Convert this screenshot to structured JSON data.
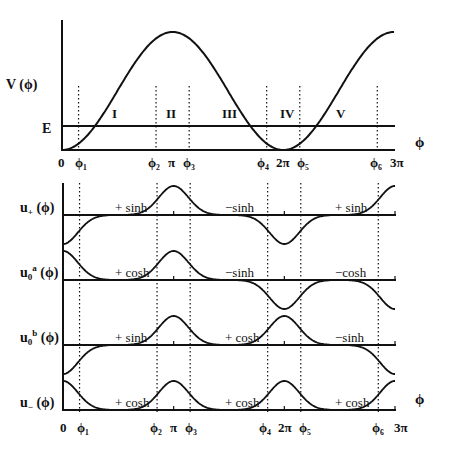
{
  "figure": {
    "top_panel": {
      "ylabel": "V (ϕ)",
      "energy_label": "E",
      "xlabel": "ϕ",
      "regions": [
        "I",
        "II",
        "III",
        "IV",
        "V"
      ],
      "x_ticks": [
        "0",
        "ϕ₁",
        "ϕ₂",
        "π",
        "ϕ₃",
        "ϕ₄",
        "2π",
        "ϕ₅",
        "ϕ₆",
        "3π"
      ]
    },
    "bottom_panel": {
      "xlabel": "ϕ",
      "x_ticks": [
        "0",
        "ϕ₁",
        "ϕ₂",
        "π",
        "ϕ₃",
        "ϕ₄",
        "2π",
        "ϕ₅",
        "ϕ₆",
        "3π"
      ],
      "rows": [
        {
          "label_main": "u",
          "label_sub": "+",
          "label_sup": "",
          "label_arg": " (ϕ)",
          "annotations": [
            "+ sinh",
            "−sinh",
            "+ sinh"
          ]
        },
        {
          "label_main": "u",
          "label_sub": "0",
          "label_sup": "a",
          "label_arg": " (ϕ)",
          "annotations": [
            "+ cosh",
            "−sinh",
            "−cosh"
          ]
        },
        {
          "label_main": "u",
          "label_sub": "0",
          "label_sup": "b",
          "label_arg": " (ϕ)",
          "annotations": [
            "+ sinh",
            "+ cosh",
            "−sinh"
          ]
        },
        {
          "label_main": "u",
          "label_sub": "−",
          "label_sup": "",
          "label_arg": " (ϕ)",
          "annotations": [
            "+ cosh",
            "+ cosh",
            "+ cosh"
          ]
        }
      ]
    }
  },
  "chart_data": {
    "type": "line",
    "title": "",
    "xlabel": "ϕ",
    "ylabel": "V (ϕ)",
    "xlim": [
      0,
      9.4248
    ],
    "x_tick_labels": [
      "0",
      "ϕ₁",
      "ϕ₂",
      "π",
      "ϕ₃",
      "ϕ₄",
      "2π",
      "ϕ₅",
      "ϕ₆",
      "3π"
    ],
    "turning_points": {
      "phi1": 0.47,
      "phi2": 2.67,
      "phi3": 3.61,
      "phi4": 5.81,
      "phi5": 6.75,
      "phi6": 8.95
    },
    "potential": {
      "form": "1 - cos(ϕ)",
      "energy_level_fraction": 0.17
    },
    "regions": [
      "I",
      "II",
      "III",
      "IV",
      "V"
    ],
    "wavefunctions": [
      {
        "name": "u+(ϕ)",
        "lobes": [
          -1,
          1,
          -1,
          -1,
          1
        ],
        "bumps": {
          "0": -1,
          "pi": 1,
          "2pi": -1,
          "3pi": 1
        },
        "annotations": [
          "+ sinh",
          "−sinh",
          "+ sinh"
        ]
      },
      {
        "name": "u0a(ϕ)",
        "bumps": {
          "0": 1,
          "pi": 1,
          "2pi": -1,
          "3pi": -1
        },
        "annotations": [
          "+ cosh",
          "−sinh",
          "−cosh"
        ]
      },
      {
        "name": "u0b(ϕ)",
        "bumps": {
          "0": -1,
          "pi": 1,
          "2pi": 1,
          "3pi": -1
        },
        "annotations": [
          "+ sinh",
          "+ cosh",
          "−sinh"
        ]
      },
      {
        "name": "u−(ϕ)",
        "bumps": {
          "0": 1,
          "pi": 1,
          "2pi": 1,
          "3pi": 1
        },
        "annotations": [
          "+ cosh",
          "+ cosh",
          "+ cosh"
        ]
      }
    ]
  }
}
